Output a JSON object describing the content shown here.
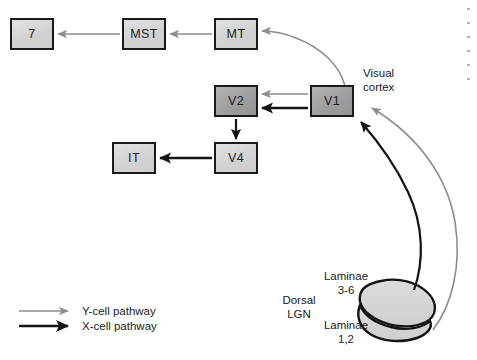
{
  "diagram": {
    "colors": {
      "y_pathway": "#8c8c8c",
      "x_pathway": "#141414",
      "box_border": "#1a1a1a",
      "box_light_fill": "#d6d6d6",
      "box_dark_fill": "#a4a4a4",
      "lgn_fill": "#d4d4d4",
      "lgn_outline": "#141414",
      "background": "#ffffff",
      "text": "#1a1a1a"
    }
  },
  "nodes": [
    {
      "id": "area7",
      "label": "7",
      "x": 10,
      "y": 18,
      "w": 44,
      "h": 32,
      "tone": "light"
    },
    {
      "id": "mst",
      "label": "MST",
      "x": 122,
      "y": 18,
      "w": 44,
      "h": 32,
      "tone": "light"
    },
    {
      "id": "mt",
      "label": "MT",
      "x": 214,
      "y": 18,
      "w": 44,
      "h": 32,
      "tone": "light"
    },
    {
      "id": "v2",
      "label": "V2",
      "x": 214,
      "y": 85,
      "w": 44,
      "h": 32,
      "tone": "dark"
    },
    {
      "id": "v1",
      "label": "V1",
      "x": 310,
      "y": 85,
      "w": 44,
      "h": 32,
      "tone": "dark"
    },
    {
      "id": "v4",
      "label": "V4",
      "x": 214,
      "y": 142,
      "w": 44,
      "h": 32,
      "tone": "light"
    },
    {
      "id": "it",
      "label": "IT",
      "x": 112,
      "y": 142,
      "w": 44,
      "h": 32,
      "tone": "light"
    }
  ],
  "labels": {
    "visual_cortex": "Visual\ncortex",
    "dorsal_lgn": "Dorsal\nLGN",
    "laminae_3_6": "Laminae\n3-6",
    "laminae_1_2": "Laminae\n1,2"
  },
  "legend": {
    "items": [
      {
        "id": "y-cell",
        "label": "Y-cell pathway",
        "color": "#8c8c8c",
        "width": 1.5
      },
      {
        "id": "x-cell",
        "label": "X-cell pathway",
        "color": "#141414",
        "width": 2.6
      }
    ]
  },
  "connections": [
    {
      "id": "mst-to-7",
      "from": "MST",
      "to": "7",
      "pathway": "Y-cell pathway"
    },
    {
      "id": "mt-to-mst",
      "from": "MT",
      "to": "MST",
      "pathway": "Y-cell pathway"
    },
    {
      "id": "v1-to-mt",
      "from": "V1",
      "to": "MT",
      "pathway": "Y-cell pathway"
    },
    {
      "id": "v1-to-v2-y",
      "from": "V1",
      "to": "V2",
      "pathway": "Y-cell pathway"
    },
    {
      "id": "v1-to-v2-x",
      "from": "V1",
      "to": "V2",
      "pathway": "X-cell pathway"
    },
    {
      "id": "v2-to-v4",
      "from": "V2",
      "to": "V4",
      "pathway": "X-cell pathway"
    },
    {
      "id": "v4-to-it",
      "from": "V4",
      "to": "IT",
      "pathway": "X-cell pathway"
    },
    {
      "id": "laminae12-to-v1",
      "from": "Laminae 1,2",
      "to": "V1",
      "pathway": "Y-cell pathway"
    },
    {
      "id": "laminae36-to-v1",
      "from": "Laminae 3-6",
      "to": "V1",
      "pathway": "X-cell pathway"
    }
  ]
}
